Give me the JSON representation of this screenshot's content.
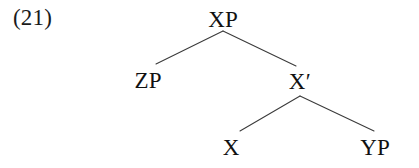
{
  "figure": {
    "kind": "syntax-tree",
    "example_number": "(21)",
    "canvas": {
      "width": 419,
      "height": 168
    },
    "colors": {
      "background": "#ffffff",
      "text": "#111111",
      "branch_line": "#3a3a3a"
    }
  },
  "tree": {
    "nodes": [
      {
        "id": "xp",
        "label": "XP",
        "role": "root-phrase",
        "x": 223,
        "label_baseline_y": 27
      },
      {
        "id": "zp",
        "label": "ZP",
        "role": "specifier",
        "x": 148,
        "label_baseline_y": 88
      },
      {
        "id": "xbar",
        "label": "X′",
        "role": "intermediate-projection",
        "x": 300,
        "label_baseline_y": 89
      },
      {
        "id": "x-head",
        "label": "X",
        "role": "head",
        "x": 231,
        "label_baseline_y": 155
      },
      {
        "id": "yp",
        "label": "YP",
        "role": "complement",
        "x": 375,
        "label_baseline_y": 155
      }
    ],
    "branches": [
      {
        "id": "xp-zp",
        "parent": "xp",
        "child": "zp",
        "x1": 223,
        "y1": 31,
        "x2": 156,
        "y2": 64
      },
      {
        "id": "xp-xbar",
        "parent": "xp",
        "child": "xbar",
        "x1": 223,
        "y1": 31,
        "x2": 296,
        "y2": 66
      },
      {
        "id": "xbar-x",
        "parent": "xbar",
        "child": "x-head",
        "x1": 300,
        "y1": 96,
        "x2": 240,
        "y2": 131
      },
      {
        "id": "xbar-yp",
        "parent": "xbar",
        "child": "yp",
        "x1": 300,
        "y1": 96,
        "x2": 374,
        "y2": 131
      }
    ]
  }
}
